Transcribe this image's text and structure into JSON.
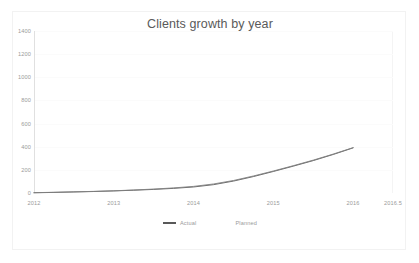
{
  "chart_data": {
    "type": "line",
    "title": "Clients growth by year",
    "xlabel": "",
    "ylabel": "",
    "grid": true,
    "legend_position": "bottom",
    "xlim": [
      2012,
      2016.5
    ],
    "ylim": [
      0,
      1400
    ],
    "x_tick_labels": [
      "2012",
      "2013",
      "2014",
      "2015",
      "2016",
      "2016.5"
    ],
    "x_ticks": [
      2012,
      2013,
      2014,
      2015,
      2016,
      2016.5
    ],
    "y_tick_labels": [
      "1400",
      "1200",
      "1000",
      "800",
      "600",
      "400",
      "200",
      "0"
    ],
    "y_ticks": [
      1400,
      1200,
      1000,
      800,
      600,
      400,
      200,
      0
    ],
    "x": [
      2012,
      2012.25,
      2012.5,
      2012.75,
      2013,
      2013.25,
      2013.5,
      2013.75,
      2014,
      2014.25,
      2014.5,
      2014.75,
      2015,
      2015.25,
      2015.5,
      2015.75,
      2016
    ],
    "series": [
      {
        "name": "Actual",
        "color": "#595959",
        "values": [
          2,
          5,
          9,
          13,
          18,
          24,
          31,
          40,
          52,
          72,
          103,
          142,
          186,
          232,
          280,
          333,
          390
        ]
      },
      {
        "name": "Planned",
        "color": "#808080",
        "values": [
          3,
          6,
          10,
          14,
          19,
          26,
          34,
          44,
          57,
          78,
          108,
          147,
          190,
          236,
          284,
          336,
          392
        ]
      }
    ],
    "colors": {
      "title": "#5a5a5a",
      "tick_label": "#9a9a9a",
      "axis": "#e0e0e0",
      "gridline": "#fbfbfb",
      "frame": "#f2f2f2",
      "background": "#ffffff"
    }
  },
  "legend": {
    "items": [
      {
        "label": "Actual"
      },
      {
        "label": "Planned"
      }
    ]
  }
}
